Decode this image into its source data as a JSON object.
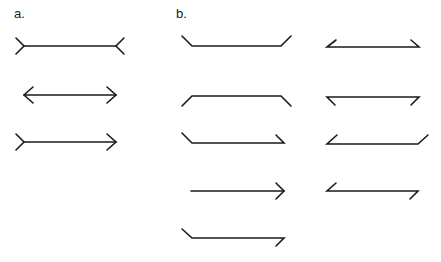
{
  "panels": {
    "a": {
      "label": "a.",
      "label_pos": [
        14,
        6
      ],
      "figures": [
        {
          "name": "muller-lyer-fins-out",
          "paths": [
            [
              [
                24,
                46
              ],
              [
                116,
                46
              ]
            ],
            [
              [
                16,
                38
              ],
              [
                24,
                46
              ],
              [
                16,
                54
              ]
            ],
            [
              [
                124,
                38
              ],
              [
                116,
                46
              ],
              [
                124,
                54
              ]
            ]
          ]
        },
        {
          "name": "muller-lyer-arrows-in",
          "paths": [
            [
              [
                24,
                95
              ],
              [
                116,
                95
              ]
            ],
            [
              [
                33,
                87
              ],
              [
                24,
                95
              ],
              [
                33,
                103
              ]
            ],
            [
              [
                107,
                87
              ],
              [
                116,
                95
              ],
              [
                107,
                103
              ]
            ]
          ]
        },
        {
          "name": "muller-lyer-mixed",
          "paths": [
            [
              [
                24,
                142
              ],
              [
                116,
                142
              ]
            ],
            [
              [
                16,
                134
              ],
              [
                24,
                142
              ],
              [
                16,
                150
              ]
            ],
            [
              [
                107,
                134
              ],
              [
                116,
                142
              ],
              [
                107,
                150
              ]
            ]
          ]
        }
      ]
    },
    "b": {
      "label": "b.",
      "label_pos": [
        176,
        6
      ],
      "figures": [
        {
          "name": "b-col1-row1",
          "paths": [
            [
              [
                182,
                36
              ],
              [
                192,
                46
              ],
              [
                281,
                46
              ],
              [
                291,
                36
              ]
            ]
          ]
        },
        {
          "name": "b-col1-row2",
          "paths": [
            [
              [
                182,
                106
              ],
              [
                192,
                96
              ],
              [
                281,
                96
              ],
              [
                291,
                106
              ]
            ]
          ]
        },
        {
          "name": "b-col1-row3",
          "paths": [
            [
              [
                182,
                133
              ],
              [
                192,
                143
              ],
              [
                284,
                143
              ],
              [
                276,
                135
              ]
            ]
          ]
        },
        {
          "name": "b-col1-row4",
          "paths": [
            [
              [
                191,
                191
              ],
              [
                284,
                191
              ]
            ],
            [
              [
                276,
                183
              ],
              [
                284,
                191
              ],
              [
                276,
                199
              ]
            ]
          ]
        },
        {
          "name": "b-col1-row5",
          "paths": [
            [
              [
                182,
                229
              ],
              [
                192,
                238
              ],
              [
                284,
                238
              ],
              [
                276,
                246
              ]
            ]
          ]
        },
        {
          "name": "b-col2-row1",
          "paths": [
            [
              [
                336,
                40
              ],
              [
                327,
                47
              ],
              [
                419,
                47
              ],
              [
                411,
                40
              ]
            ]
          ]
        },
        {
          "name": "b-col2-row2",
          "paths": [
            [
              [
                335,
                105
              ],
              [
                327,
                97
              ],
              [
                419,
                97
              ],
              [
                411,
                105
              ]
            ]
          ]
        },
        {
          "name": "b-col2-row3",
          "paths": [
            [
              [
                337,
                135
              ],
              [
                327,
                144
              ],
              [
                418,
                144
              ],
              [
                428,
                135
              ]
            ]
          ]
        },
        {
          "name": "b-col2-row4",
          "paths": [
            [
              [
                336,
                183
              ],
              [
                327,
                191
              ],
              [
                418,
                191
              ],
              [
                410,
                199
              ]
            ]
          ]
        }
      ]
    }
  },
  "colors": {
    "stroke": "#1a1a1a",
    "background": "#ffffff"
  }
}
